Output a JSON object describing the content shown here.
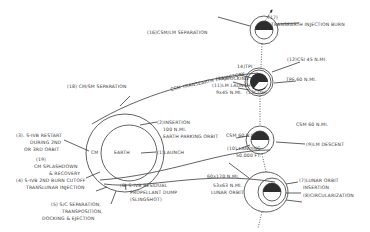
{
  "diagram": {
    "type": "apollo-lunar-mission-profile",
    "colors": {
      "line": "#3a3a3a",
      "background": "#ffffff"
    },
    "earth": {
      "label": "EARTH",
      "cm_label": "CM"
    },
    "labels": {
      "l1_launch": "(1)LAUNCH",
      "l2_insertion_a": "(2)INSERTION",
      "l2_insertion_b": "100 N.MI.",
      "l2_insertion_c": "EARTH PARKING ORBIT",
      "l3_a": "(3). S-IVB RESTART",
      "l3_b": "DURING 2ND",
      "l3_c": "OR 3RD ORBIT",
      "l4_a": "(4) S-IVB 2ND BURN CUTOFF",
      "l4_b": "TRANSLUNAR INJECTION",
      "l5_a": "(5) S/C SEPARATION,",
      "l5_b": "TRANSPOSITION,",
      "l5_c": "DOCKING & EJECTION",
      "l6_a": "(6) S-IVB RESIDUAL",
      "l6_b": "PROPELLANT DUMP",
      "l6_c": "(SLINGSHOT)",
      "l7_a": "(7)LUNAR ORBIT",
      "l7_b": "INSERTION",
      "l8": "(8)CIRCULARIZATION",
      "l9": "(9)LM DESCENT",
      "l10_a": "(10) LANDING",
      "l10_b": "50,000 FT.",
      "l11_a": "(11)LM LAUNCH",
      "l11_b": "9x45 N.MI.",
      "l12": "(12)CSI 45 N.MI.",
      "l13": "(13CDH)",
      "l14": "14)TPI",
      "l15": "(15)DOCKING",
      "l16": "(16)CSM/LM SEPARATION",
      "l17_a": "(17)",
      "l17_b": "TRANSEARTH INJECTION BURN",
      "l18": "(18) CM/SM SEPARATION",
      "l19_a": "(19)",
      "l19_b": "CM SPLASHDOWN",
      "l19_c": "& RECOVERY",
      "tpf": "TPF 60 N.MI.",
      "csm60_a": "CSM 60 N.MI.",
      "csm60_b": "CSM 60 N.MI.",
      "orbit_60x170": "60x170 N.MI.",
      "orbit_53x63_a": "53x63 N.MI.",
      "orbit_53x63_b": "LUNAR ORBIT",
      "trajectory": "CSM TRANSEARTH TRAJECTORY"
    }
  }
}
